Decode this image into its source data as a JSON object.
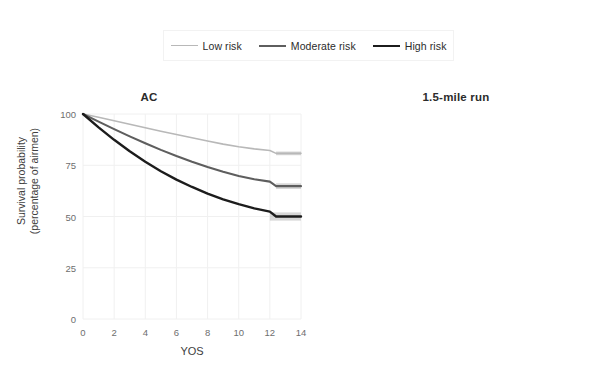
{
  "legend": {
    "position": "top-center",
    "entries": [
      {
        "label": "Low risk",
        "color": "#b8b8b8",
        "width": 1.6
      },
      {
        "label": "Moderate risk",
        "color": "#5e5e5e",
        "width": 2.1
      },
      {
        "label": "High risk",
        "color": "#1c1c1c",
        "width": 2.4
      }
    ]
  },
  "axes": {
    "ylabel_line1": "Survival probability",
    "ylabel_line2": "(percentage of airmen)",
    "xlabel": "YOS",
    "yticks": [
      0,
      25,
      50,
      75,
      100
    ],
    "xticks": [
      0,
      2,
      4,
      6,
      8,
      10,
      12,
      14
    ]
  },
  "colors": {
    "grid": "#f0f0f0",
    "axis_text": "#6e6e6e",
    "title_text": "#2b2b2b",
    "band": "#9a9a9a",
    "panel_background": "#ffffff"
  },
  "chart_data": [
    {
      "type": "line",
      "title": "AC",
      "xlabel": "YOS",
      "ylabel": "Survival probability (percentage of airmen)",
      "xlim": [
        0,
        14
      ],
      "ylim": [
        0,
        100
      ],
      "grid": true,
      "x": [
        0,
        1,
        2,
        3,
        4,
        5,
        6,
        7,
        8,
        9,
        10,
        11,
        12,
        12.4,
        14
      ],
      "series": [
        {
          "name": "Low risk",
          "color": "#b8b8b8",
          "values": [
            100,
            98.4,
            96.7,
            95.0,
            93.3,
            91.6,
            90.0,
            88.4,
            86.8,
            85.3,
            84.0,
            83.0,
            82.2,
            80.8,
            80.8
          ],
          "ci_band": {
            "x_start": 12.4,
            "x_end": 14,
            "low": 79.9,
            "high": 81.7
          }
        },
        {
          "name": "Moderate risk",
          "color": "#5e5e5e",
          "values": [
            100,
            96.3,
            92.6,
            89.1,
            85.7,
            82.5,
            79.5,
            76.7,
            74.1,
            71.8,
            69.8,
            68.2,
            67.0,
            64.8,
            64.8
          ],
          "ci_band": {
            "x_start": 12.4,
            "x_end": 14,
            "low": 63.4,
            "high": 66.2
          }
        },
        {
          "name": "High risk",
          "color": "#1c1c1c",
          "values": [
            100,
            93.5,
            87.4,
            81.8,
            76.7,
            72.1,
            68.0,
            64.4,
            61.2,
            58.4,
            56.0,
            54.0,
            52.4,
            50.0,
            50.0
          ],
          "ci_band": {
            "x_start": 12.0,
            "x_end": 14,
            "low": 48.0,
            "high": 52.0
          }
        }
      ]
    },
    {
      "type": "line",
      "title": "1.5-mile run",
      "xlabel": "YOS",
      "ylabel": "Survival probability (percentage of airmen)",
      "xlim": [
        0,
        14
      ],
      "ylim": [
        0,
        100
      ],
      "grid": true,
      "x": [
        0,
        1,
        2,
        3,
        4,
        5,
        6,
        7,
        8,
        9,
        10,
        11,
        12,
        12.4,
        14
      ],
      "series": [
        {
          "name": "Low risk",
          "color": "#b8b8b8",
          "values": [
            100,
            98.5,
            97.0,
            95.5,
            94.0,
            92.5,
            91.0,
            89.5,
            88.0,
            86.5,
            85.0,
            83.6,
            82.2,
            79.3,
            79.3
          ],
          "ci_band": {
            "x_start": 12.4,
            "x_end": 14,
            "low": 78.5,
            "high": 80.1
          }
        },
        {
          "name": "Moderate risk",
          "color": "#5e5e5e",
          "values": [
            100,
            97.8,
            95.6,
            93.4,
            91.2,
            89.0,
            86.8,
            84.6,
            82.4,
            80.2,
            78.1,
            76.2,
            74.4,
            72.0,
            72.0
          ],
          "ci_band": {
            "x_start": 12.4,
            "x_end": 14,
            "low": 71.0,
            "high": 73.0
          }
        },
        {
          "name": "High risk",
          "color": "#1c1c1c",
          "values": [
            100,
            97.1,
            94.2,
            91.3,
            88.4,
            85.5,
            82.6,
            79.7,
            76.8,
            74.0,
            71.2,
            68.6,
            66.2,
            61.8,
            61.8
          ],
          "ci_band": {
            "x_start": 12.0,
            "x_end": 14,
            "low": 59.8,
            "high": 63.8
          }
        }
      ]
    }
  ]
}
